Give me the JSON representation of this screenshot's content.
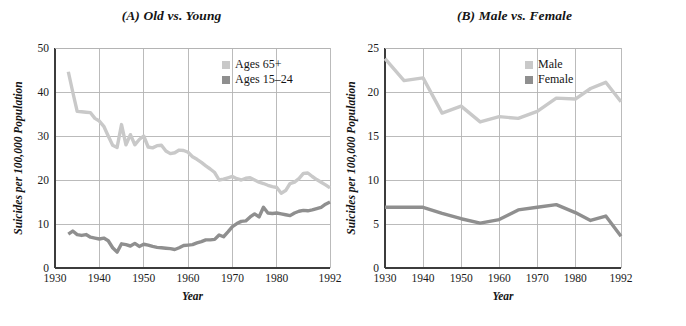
{
  "figure": {
    "background_color": "#ffffff",
    "text_color": "#141414",
    "gridline_color": "#b4b4b4",
    "axis_color": "#3c3c3c"
  },
  "chart_data": [
    {
      "type": "line",
      "panel_id": "A",
      "title": "(A) Old vs. Young",
      "xlabel": "Year",
      "ylabel": "Suicides per 100,000 Population",
      "xlim": [
        1930,
        1992
      ],
      "ylim": [
        0,
        50
      ],
      "xticks": [
        1930,
        1940,
        1950,
        1960,
        1970,
        1980,
        1992
      ],
      "xtick_labels": [
        "1930",
        "1940",
        "1950",
        "1960",
        "1970",
        "1980",
        "1992"
      ],
      "yticks": [
        0,
        10,
        20,
        30,
        40,
        50
      ],
      "ytick_labels": [
        "0",
        "10",
        "20",
        "30",
        "40",
        "50"
      ],
      "grid": true,
      "legend_position": "top-right",
      "series": [
        {
          "name": "Ages 65+",
          "color": "#c9c9c9",
          "linewidth": 3.4,
          "x": [
            1933,
            1934,
            1935,
            1936,
            1937,
            1938,
            1939,
            1940,
            1941,
            1942,
            1943,
            1944,
            1945,
            1946,
            1947,
            1948,
            1949,
            1950,
            1951,
            1952,
            1953,
            1954,
            1955,
            1956,
            1957,
            1958,
            1959,
            1960,
            1961,
            1962,
            1963,
            1964,
            1965,
            1966,
            1967,
            1968,
            1969,
            1970,
            1971,
            1972,
            1973,
            1974,
            1975,
            1976,
            1977,
            1978,
            1979,
            1980,
            1981,
            1982,
            1983,
            1984,
            1985,
            1986,
            1987,
            1988,
            1989,
            1990,
            1991,
            1992
          ],
          "y": [
            44.6,
            40.0,
            35.6,
            35.5,
            35.4,
            35.3,
            34.0,
            33.4,
            32.2,
            30.0,
            27.9,
            27.4,
            32.6,
            28.0,
            30.3,
            28.0,
            29.2,
            30.0,
            27.5,
            27.3,
            27.8,
            27.9,
            26.6,
            26.0,
            26.2,
            26.8,
            26.7,
            26.3,
            25.3,
            24.7,
            24.0,
            23.2,
            22.5,
            21.7,
            20.0,
            20.2,
            20.5,
            20.8,
            20.3,
            20.0,
            20.4,
            20.5,
            20.0,
            19.5,
            19.2,
            18.8,
            18.5,
            18.3,
            17.0,
            17.6,
            19.2,
            19.5,
            20.3,
            21.5,
            21.6,
            20.8,
            20.1,
            19.5,
            18.9,
            18.2
          ]
        },
        {
          "name": "Ages 15–24",
          "color": "#8f8f8f",
          "linewidth": 3.4,
          "x": [
            1933,
            1934,
            1935,
            1936,
            1937,
            1938,
            1939,
            1940,
            1941,
            1942,
            1943,
            1944,
            1945,
            1946,
            1947,
            1948,
            1949,
            1950,
            1951,
            1952,
            1953,
            1954,
            1955,
            1956,
            1957,
            1958,
            1959,
            1960,
            1961,
            1962,
            1963,
            1964,
            1965,
            1966,
            1967,
            1968,
            1969,
            1970,
            1971,
            1972,
            1973,
            1974,
            1975,
            1976,
            1977,
            1978,
            1979,
            1980,
            1981,
            1982,
            1983,
            1984,
            1985,
            1986,
            1987,
            1988,
            1989,
            1990,
            1991,
            1992
          ],
          "y": [
            7.7,
            8.4,
            7.6,
            7.4,
            7.6,
            7.0,
            6.8,
            6.6,
            6.8,
            6.2,
            4.6,
            3.6,
            5.5,
            5.3,
            5.0,
            5.6,
            4.9,
            5.4,
            5.2,
            4.9,
            4.7,
            4.6,
            4.5,
            4.4,
            4.2,
            4.6,
            5.1,
            5.2,
            5.3,
            5.7,
            6.0,
            6.4,
            6.4,
            6.5,
            7.5,
            7.1,
            8.2,
            9.4,
            10.1,
            10.6,
            10.7,
            11.6,
            12.3,
            11.6,
            13.8,
            12.5,
            12.4,
            12.5,
            12.3,
            12.1,
            11.9,
            12.5,
            12.9,
            13.1,
            13.0,
            13.2,
            13.5,
            13.8,
            14.5,
            15.0
          ]
        }
      ]
    },
    {
      "type": "line",
      "panel_id": "B",
      "title": "(B) Male vs. Female",
      "xlabel": "Year",
      "ylabel": "Suicides per 100,000 Population",
      "xlim": [
        1930,
        1992
      ],
      "ylim": [
        0,
        25
      ],
      "xticks": [
        1930,
        1940,
        1950,
        1960,
        1970,
        1980,
        1992
      ],
      "xtick_labels": [
        "1930",
        "1940",
        "1950",
        "1960",
        "1970",
        "1980",
        "1992"
      ],
      "yticks": [
        0,
        5,
        10,
        15,
        20,
        25
      ],
      "ytick_labels": [
        "0",
        "5",
        "10",
        "15",
        "20",
        "25"
      ],
      "grid": true,
      "legend_position": "top-right",
      "series": [
        {
          "name": "Male",
          "color": "#c9c9c9",
          "linewidth": 3.4,
          "x": [
            1930,
            1935,
            1940,
            1945,
            1950,
            1955,
            1960,
            1965,
            1970,
            1975,
            1980,
            1984,
            1988,
            1992
          ],
          "y": [
            23.8,
            21.3,
            21.6,
            17.6,
            18.4,
            16.6,
            17.2,
            17.0,
            17.8,
            19.3,
            19.2,
            20.4,
            21.1,
            18.9
          ]
        },
        {
          "name": "Female",
          "color": "#8f8f8f",
          "linewidth": 3.4,
          "x": [
            1930,
            1935,
            1940,
            1945,
            1950,
            1955,
            1960,
            1965,
            1970,
            1975,
            1980,
            1984,
            1988,
            1992
          ],
          "y": [
            6.9,
            6.9,
            6.9,
            6.2,
            5.6,
            5.1,
            5.5,
            6.6,
            6.9,
            7.2,
            6.3,
            5.4,
            5.9,
            3.6
          ]
        }
      ]
    }
  ]
}
